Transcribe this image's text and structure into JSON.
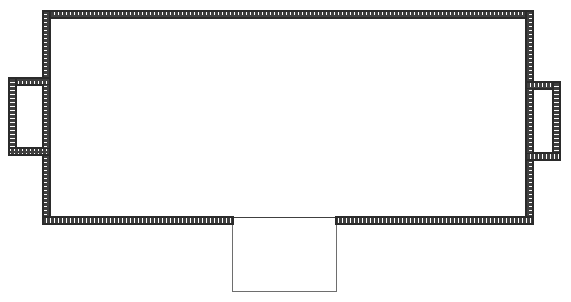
{
  "document": {
    "kind": "architectural-floor-plan",
    "title": "Floor Plan Outline",
    "canvas": {
      "width": 571,
      "height": 302
    },
    "background_color": "#ffffff"
  },
  "style": {
    "wall_stroke_color": "#2b2b2b",
    "wall_hatch_color": "#3a3a3a",
    "wall_hatch_gap_color": "#ffffff",
    "wall_fill_color": "#4a4a4a",
    "thin_line_color": "#6e6e6e",
    "wall_stroke_width": 1.2,
    "thin_line_width": 1.3,
    "hatch_dash_length": 2.2,
    "hatch_dash_gap": 1.8
  },
  "geometry": {
    "wall_thickness": 7,
    "main_room": {
      "name": "main-room",
      "outer": {
        "x": 43,
        "y": 11,
        "width": 490,
        "height": 213
      },
      "inner": {
        "x": 50,
        "y": 18,
        "width": 476,
        "height": 199
      },
      "wall_type": "hatched-thick"
    },
    "left_alcove": {
      "name": "left-alcove",
      "outer": {
        "x": 9,
        "y": 78,
        "width": 41,
        "height": 77
      },
      "inner": {
        "x": 16,
        "y": 85,
        "width": 34,
        "height": 63
      },
      "attach_edge": "left",
      "wall_type": "hatched-thick"
    },
    "right_alcove": {
      "name": "right-alcove",
      "outer": {
        "x": 526,
        "y": 82,
        "width": 34,
        "height": 78
      },
      "inner": {
        "x": 526,
        "y": 89,
        "width": 27,
        "height": 64
      },
      "attach_edge": "right",
      "wall_type": "hatched-thick"
    },
    "bottom_bay": {
      "name": "bottom-bay",
      "opening": {
        "x_start": 232,
        "x_end": 337
      },
      "top_y": 221,
      "bottom_y": 292,
      "wall_type": "thin-single-line"
    }
  },
  "labels": {
    "main_room": "main-room",
    "left_alcove": "left-alcove",
    "right_alcove": "right-alcove",
    "bottom_bay": "bottom-bay"
  }
}
